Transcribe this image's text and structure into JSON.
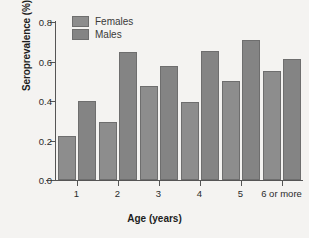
{
  "chart_data": {
    "type": "bar",
    "title": "",
    "xlabel": "Age (years)",
    "ylabel": "Seroprevalence (%)",
    "categories": [
      "1",
      "2",
      "3",
      "4",
      "5",
      "6 or more"
    ],
    "series": [
      {
        "name": "Females",
        "values": [
          0.225,
          0.295,
          0.475,
          0.395,
          0.5,
          0.55
        ],
        "color": "#8d8d8d"
      },
      {
        "name": "Males",
        "values": [
          0.4,
          0.648,
          0.575,
          0.655,
          0.71,
          0.615
        ],
        "color": "#848484"
      }
    ],
    "ylim": [
      0.0,
      0.8
    ],
    "yticks": [
      "0.0",
      "0.2",
      "0.4",
      "0.6",
      "0.8"
    ],
    "ytick_values": [
      0.0,
      0.2,
      0.4,
      0.6,
      0.8
    ],
    "grid": false,
    "legend_position": "top-left",
    "legend": [
      "Females",
      "Males"
    ],
    "background_color": "#f4f3f1",
    "axis_color": "#555555"
  }
}
